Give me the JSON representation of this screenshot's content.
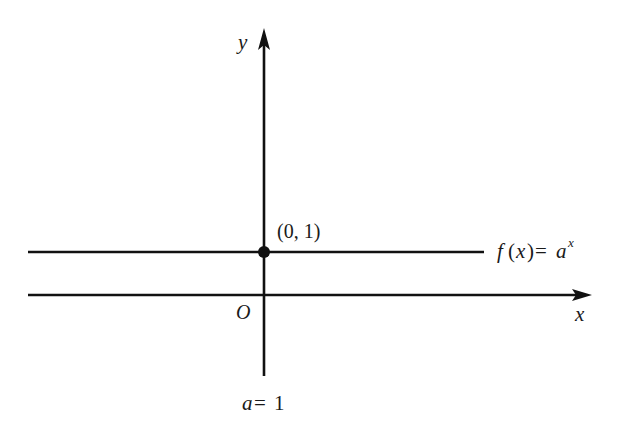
{
  "figure": {
    "axes": {
      "x_label": "x",
      "y_label": "y",
      "origin_label": "O"
    },
    "curve": {
      "label_f": "f",
      "label_paren_open": "(",
      "label_var": "x",
      "label_paren_close": ")",
      "label_eq": "=",
      "label_base": "a",
      "label_exp": "x",
      "description": "f(x)=a^x (horizontal line y=1)"
    },
    "point": {
      "label": "(0, 1)"
    },
    "condition": {
      "var": "a",
      "eq": "=",
      "value": "1"
    },
    "colors": {
      "stroke": "#111111",
      "background": "#ffffff"
    }
  }
}
